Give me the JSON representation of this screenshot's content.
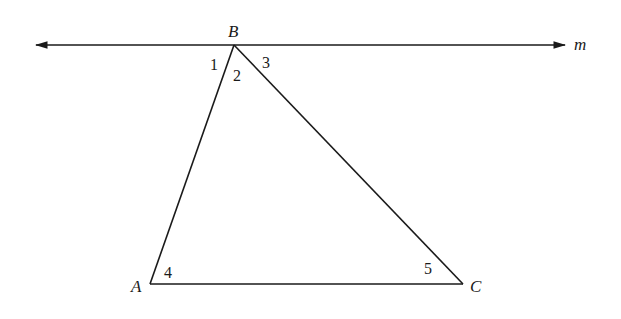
{
  "diagram": {
    "stroke_color": "#1a1a1a",
    "line_m": {
      "label": "m",
      "x1": 36,
      "y1": 45,
      "x2": 565,
      "y2": 45,
      "label_pos": [
        574,
        50
      ]
    },
    "points": {
      "A": {
        "label": "A",
        "x": 150,
        "y": 284,
        "label_pos": [
          131,
          292
        ]
      },
      "B": {
        "label": "B",
        "x": 234,
        "y": 45,
        "label_pos": [
          228,
          37
        ]
      },
      "C": {
        "label": "C",
        "x": 463,
        "y": 284,
        "label_pos": [
          470,
          292
        ]
      }
    },
    "angles": [
      {
        "label": "1",
        "pos": [
          210,
          70
        ]
      },
      {
        "label": "2",
        "pos": [
          233,
          81
        ]
      },
      {
        "label": "3",
        "pos": [
          262,
          68
        ]
      },
      {
        "label": "4",
        "pos": [
          164,
          278
        ]
      },
      {
        "label": "5",
        "pos": [
          424,
          274
        ]
      }
    ]
  }
}
